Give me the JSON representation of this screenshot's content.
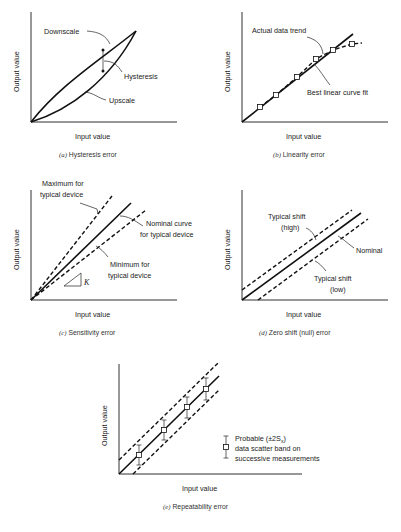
{
  "figure": {
    "panels": [
      {
        "id": "a",
        "caption_letter": "(a)",
        "caption_text": "Hysteresis error",
        "xlabel": "Input value",
        "ylabel": "Output value",
        "annotations": [
          "Downscale",
          "Hysteresis",
          "Upscale"
        ]
      },
      {
        "id": "b",
        "caption_letter": "(b)",
        "caption_text": "Linearity error",
        "xlabel": "Input value",
        "ylabel": "Output value",
        "annotations": [
          "Actual data trend",
          "Best linear curve fit"
        ]
      },
      {
        "id": "c",
        "caption_letter": "(c)",
        "caption_text": "Sensitivity error",
        "xlabel": "Input value",
        "ylabel": "Output value",
        "annotations": [
          "Maximum for",
          "typical device",
          "Nominal curve",
          "for typical device",
          "Minimum for",
          "typical device",
          "K"
        ]
      },
      {
        "id": "d",
        "caption_letter": "(d)",
        "caption_text": "Zero shift (null) error",
        "xlabel": "Input value",
        "ylabel": "Output value",
        "annotations": [
          "Typical shift",
          "(high)",
          "Nominal",
          "Typical shift",
          "(low)"
        ]
      },
      {
        "id": "e",
        "caption_letter": "(e)",
        "caption_text": "Repeatability error",
        "xlabel": "Input value",
        "ylabel": "Output value",
        "legend": [
          "Probable (±2S",
          "x",
          ")",
          "data scatter band on",
          "successive measurements"
        ]
      }
    ]
  }
}
